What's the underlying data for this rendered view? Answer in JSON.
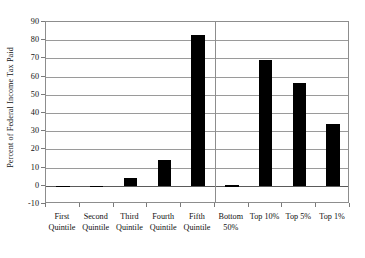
{
  "chart_data": {
    "type": "bar",
    "title": "",
    "xlabel": "",
    "ylabel": "Percent of Federal Income Tax Paid",
    "categories": [
      "First Quintile",
      "Second Quintile",
      "Third Quintile",
      "Fourth Quintile",
      "Fifth Quintile",
      "Bottom 50%",
      "Top 10%",
      "Top 5%",
      "Top 1%"
    ],
    "category_lines": [
      [
        "First",
        "Quintile"
      ],
      [
        "Second",
        "Quintile"
      ],
      [
        "Third",
        "Quintile"
      ],
      [
        "Fourth",
        "Quintile"
      ],
      [
        "Fifth",
        "Quintile"
      ],
      [
        "Bottom",
        "50%"
      ],
      [
        "Top 10%",
        ""
      ],
      [
        "Top 5%",
        ""
      ],
      [
        "Top 1%",
        ""
      ]
    ],
    "values": [
      -0.7,
      -0.6,
      4.2,
      14.2,
      83,
      0.4,
      69,
      56.5,
      34
    ],
    "ylim": [
      -10,
      90
    ],
    "ytick_values": [
      90,
      80,
      70,
      60,
      50,
      40,
      30,
      20,
      10,
      0,
      -10
    ],
    "ytick_labels": [
      "90",
      "80",
      "70",
      "60",
      "50",
      "40",
      "30",
      "20",
      "10",
      "0",
      "-10"
    ],
    "grid": true,
    "legend": "none",
    "bar_color": "#000000",
    "grid_color": "#9a9a9a",
    "axis_color": "#8d8d8d",
    "group_separator_after_index": 4
  }
}
